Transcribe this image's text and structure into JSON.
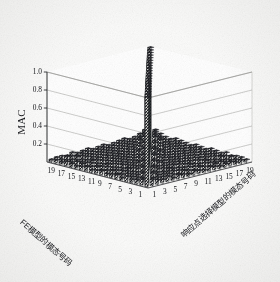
{
  "figure": {
    "kind": "3d-bar-chart",
    "background_color": "#fbfbfa",
    "ink_color": "#15161a",
    "grid_color": "#9a9a96"
  },
  "axes": {
    "z": {
      "label": "MAC",
      "ticks": [
        "1.0",
        "0.8",
        "0.6",
        "0.4",
        "0.2"
      ],
      "tick_values": [
        1.0,
        0.8,
        0.6,
        0.4,
        0.2
      ],
      "range": [
        0,
        1
      ]
    },
    "x_left": {
      "label": "FE模型的模态号码",
      "ticks": [
        "1",
        "3",
        "5",
        "7",
        "9",
        "11",
        "13",
        "15",
        "17",
        "19"
      ],
      "range": [
        1,
        20
      ]
    },
    "y_right": {
      "label": "响应点选择模型的模态号码",
      "ticks": [
        "1",
        "3",
        "5",
        "7",
        "9",
        "11",
        "13",
        "15",
        "17",
        "19"
      ],
      "range": [
        1,
        20
      ]
    }
  },
  "chart_data": {
    "type": "bar",
    "title": "",
    "xlabel": "FE模型的模态号码",
    "ylabel": "响应点选择模型的模态号码",
    "zlabel": "MAC",
    "xlabel_en": "Mode number of FE model",
    "ylabel_en": "Mode number of response-point-selected model",
    "zlabel_en": "MAC",
    "grid": true,
    "legend": "none",
    "zlim": [
      0,
      1
    ],
    "ztick_labels": [
      "1.0",
      "0.8",
      "0.6",
      "0.4",
      "0.2"
    ],
    "x_categories": [
      1,
      2,
      3,
      4,
      5,
      6,
      7,
      8,
      9,
      10,
      11,
      12,
      13,
      14,
      15,
      16,
      17,
      18,
      19,
      20
    ],
    "y_categories": [
      1,
      2,
      3,
      4,
      5,
      6,
      7,
      8,
      9,
      10,
      11,
      12,
      13,
      14,
      15,
      16,
      17,
      18,
      19,
      20
    ],
    "values": [
      [
        1.0,
        0.07,
        0.05,
        0.04,
        0.06,
        0.03,
        0.05,
        0.04,
        0.03,
        0.05,
        0.04,
        0.03,
        0.05,
        0.04,
        0.03,
        0.04,
        0.05,
        0.03,
        0.04,
        0.03
      ],
      [
        0.07,
        1.0,
        0.06,
        0.05,
        0.04,
        0.06,
        0.04,
        0.03,
        0.05,
        0.04,
        0.03,
        0.05,
        0.04,
        0.03,
        0.04,
        0.05,
        0.03,
        0.04,
        0.03,
        0.04
      ],
      [
        0.05,
        0.06,
        1.0,
        0.08,
        0.05,
        0.04,
        0.06,
        0.05,
        0.04,
        0.03,
        0.05,
        0.04,
        0.03,
        0.05,
        0.04,
        0.03,
        0.04,
        0.03,
        0.05,
        0.04
      ],
      [
        0.04,
        0.05,
        0.08,
        1.0,
        0.07,
        0.05,
        0.04,
        0.06,
        0.05,
        0.04,
        0.03,
        0.05,
        0.04,
        0.03,
        0.05,
        0.04,
        0.03,
        0.05,
        0.04,
        0.03
      ],
      [
        0.06,
        0.04,
        0.05,
        0.07,
        1.0,
        0.09,
        0.06,
        0.05,
        0.04,
        0.06,
        0.05,
        0.04,
        0.03,
        0.05,
        0.04,
        0.03,
        0.05,
        0.04,
        0.03,
        0.05
      ],
      [
        0.03,
        0.06,
        0.04,
        0.05,
        0.09,
        1.0,
        0.08,
        0.06,
        0.05,
        0.04,
        0.06,
        0.05,
        0.04,
        0.03,
        0.05,
        0.04,
        0.03,
        0.05,
        0.04,
        0.03
      ],
      [
        0.05,
        0.04,
        0.06,
        0.04,
        0.06,
        0.08,
        1.0,
        0.1,
        0.07,
        0.05,
        0.04,
        0.06,
        0.05,
        0.04,
        0.03,
        0.05,
        0.04,
        0.03,
        0.05,
        0.04
      ],
      [
        0.04,
        0.03,
        0.05,
        0.06,
        0.05,
        0.06,
        0.1,
        1.0,
        0.09,
        0.06,
        0.05,
        0.04,
        0.06,
        0.05,
        0.04,
        0.03,
        0.05,
        0.04,
        0.03,
        0.05
      ],
      [
        0.03,
        0.05,
        0.04,
        0.05,
        0.04,
        0.05,
        0.07,
        0.09,
        1.0,
        0.11,
        0.07,
        0.05,
        0.04,
        0.06,
        0.05,
        0.04,
        0.03,
        0.05,
        0.04,
        0.03
      ],
      [
        0.05,
        0.04,
        0.03,
        0.04,
        0.06,
        0.04,
        0.05,
        0.06,
        0.11,
        1.0,
        0.1,
        0.07,
        0.05,
        0.04,
        0.06,
        0.05,
        0.04,
        0.03,
        0.05,
        0.04
      ],
      [
        0.04,
        0.03,
        0.05,
        0.03,
        0.05,
        0.06,
        0.04,
        0.05,
        0.07,
        0.1,
        1.0,
        0.12,
        0.08,
        0.05,
        0.04,
        0.06,
        0.05,
        0.04,
        0.03,
        0.05
      ],
      [
        0.03,
        0.05,
        0.04,
        0.05,
        0.04,
        0.05,
        0.06,
        0.04,
        0.05,
        0.07,
        0.12,
        1.0,
        0.11,
        0.07,
        0.05,
        0.04,
        0.06,
        0.05,
        0.04,
        0.03
      ],
      [
        0.05,
        0.04,
        0.03,
        0.04,
        0.03,
        0.04,
        0.05,
        0.06,
        0.04,
        0.05,
        0.08,
        0.11,
        1.0,
        0.13,
        0.08,
        0.05,
        0.04,
        0.06,
        0.05,
        0.04
      ],
      [
        0.04,
        0.03,
        0.05,
        0.03,
        0.05,
        0.03,
        0.04,
        0.05,
        0.06,
        0.04,
        0.05,
        0.07,
        0.13,
        1.0,
        0.12,
        0.08,
        0.05,
        0.04,
        0.06,
        0.05
      ],
      [
        0.03,
        0.04,
        0.04,
        0.05,
        0.04,
        0.05,
        0.03,
        0.04,
        0.05,
        0.06,
        0.04,
        0.05,
        0.08,
        0.12,
        1.0,
        0.14,
        0.09,
        0.05,
        0.04,
        0.06
      ],
      [
        0.04,
        0.05,
        0.03,
        0.04,
        0.03,
        0.04,
        0.05,
        0.03,
        0.04,
        0.05,
        0.06,
        0.04,
        0.05,
        0.08,
        0.14,
        1.0,
        0.13,
        0.08,
        0.05,
        0.04
      ],
      [
        0.05,
        0.03,
        0.04,
        0.03,
        0.05,
        0.03,
        0.04,
        0.05,
        0.03,
        0.04,
        0.05,
        0.06,
        0.04,
        0.05,
        0.09,
        0.13,
        1.0,
        0.12,
        0.07,
        0.05
      ],
      [
        0.03,
        0.04,
        0.03,
        0.05,
        0.04,
        0.05,
        0.03,
        0.04,
        0.05,
        0.03,
        0.04,
        0.05,
        0.06,
        0.04,
        0.05,
        0.08,
        0.12,
        1.0,
        0.11,
        0.07
      ],
      [
        0.04,
        0.03,
        0.05,
        0.04,
        0.03,
        0.04,
        0.05,
        0.03,
        0.04,
        0.05,
        0.03,
        0.04,
        0.05,
        0.06,
        0.04,
        0.05,
        0.07,
        0.11,
        1.0,
        0.1
      ],
      [
        0.03,
        0.04,
        0.04,
        0.03,
        0.05,
        0.03,
        0.04,
        0.05,
        0.03,
        0.04,
        0.05,
        0.03,
        0.04,
        0.05,
        0.06,
        0.04,
        0.05,
        0.07,
        0.1,
        1.0
      ]
    ]
  }
}
